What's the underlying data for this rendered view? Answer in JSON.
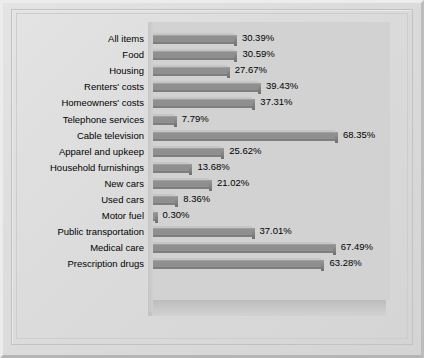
{
  "chart_data": {
    "type": "bar",
    "orientation": "horizontal",
    "title": "",
    "xlabel": "",
    "ylabel": "",
    "grid": false,
    "legend": "none",
    "xlim": [
      0,
      68.35
    ],
    "value_suffix": "%",
    "categories": [
      "All items",
      "Food",
      "Housing",
      "Renters' costs",
      "Homeowners' costs",
      "Telephone services",
      "Cable television",
      "Apparel and upkeep",
      "Household furnishings",
      "New cars",
      "Used cars",
      "Motor fuel",
      "Public transportation",
      "Medical care",
      "Prescription drugs"
    ],
    "values": [
      30.39,
      30.59,
      27.67,
      39.43,
      37.31,
      7.79,
      68.35,
      25.62,
      13.68,
      21.02,
      8.36,
      0.3,
      37.01,
      67.49,
      63.28
    ],
    "value_labels": [
      "30.39%",
      "30.59%",
      "27.67%",
      "39.43%",
      "37.31%",
      "7.79%",
      "68.35%",
      "25.62%",
      "13.68%",
      "21.02%",
      "8.36%",
      "0.30%",
      "37.01%",
      "67.49%",
      "63.28%"
    ],
    "colors": {
      "bar_top": "#c6c6c6",
      "bar_face": "#8f8f8f",
      "bar_shadow": "#7e7e7e",
      "plot_background": "#d2d2d2",
      "panel_background": "#dcdcdc",
      "text": "#000000"
    }
  }
}
